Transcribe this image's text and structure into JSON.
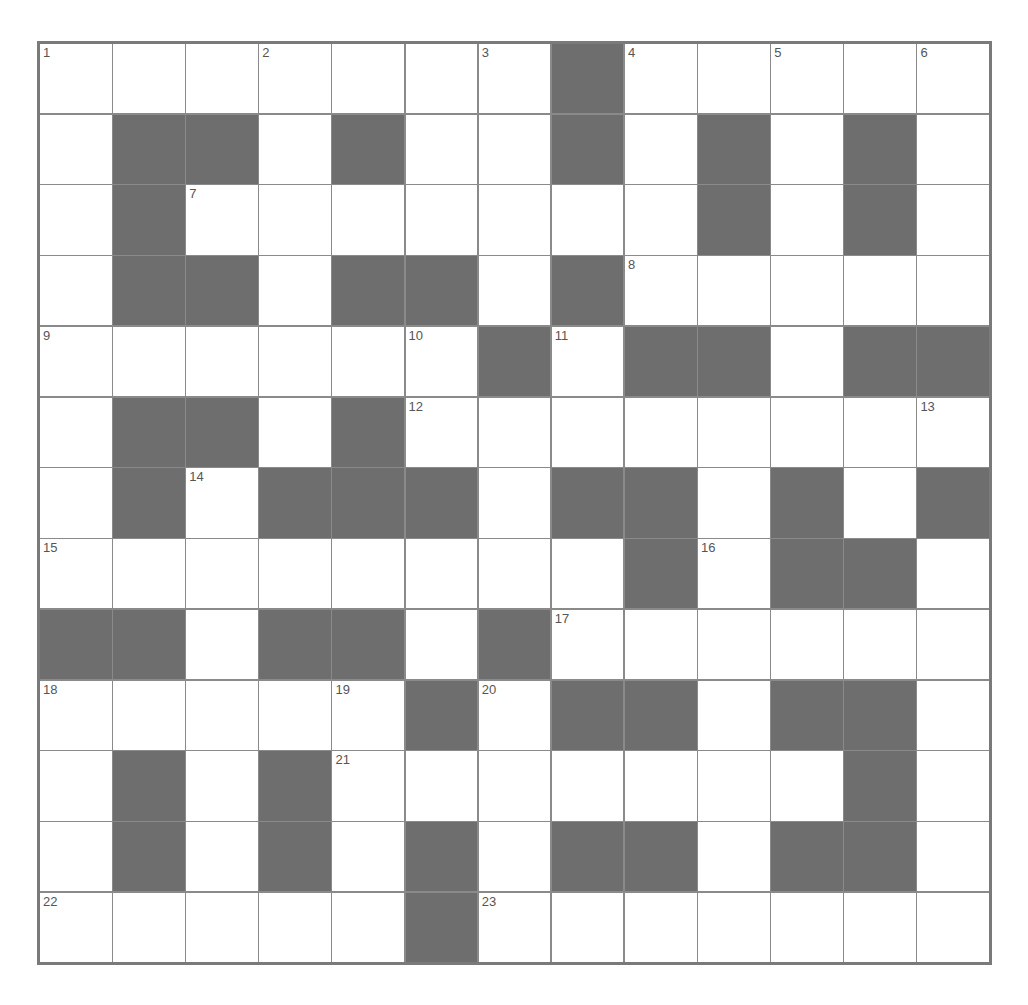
{
  "puzzle": {
    "rows": 13,
    "cols": 13,
    "colors": {
      "block": "#6e6e6e",
      "cell": "#ffffff",
      "line": "#8a8a8a",
      "border": "#7a7a7a",
      "number": "#555555"
    },
    "layout": [
      "....... .....",
      ".  . .. . . .",
      ". ....... . .",
      ".  .  . .....",
      "...... .  .  ",
      ".  . ........",
      ". .   .  . . ",
      "........ .  .",
      "  .  . ......",
      "..... .  .  .",
      ". . ....... .",
      ". . . .  .  .",
      "..... ......."
    ],
    "numbers": [
      {
        "r": 0,
        "c": 0,
        "n": "1"
      },
      {
        "r": 0,
        "c": 3,
        "n": "2"
      },
      {
        "r": 0,
        "c": 6,
        "n": "3"
      },
      {
        "r": 0,
        "c": 8,
        "n": "4"
      },
      {
        "r": 0,
        "c": 10,
        "n": "5"
      },
      {
        "r": 0,
        "c": 12,
        "n": "6"
      },
      {
        "r": 2,
        "c": 2,
        "n": "7"
      },
      {
        "r": 3,
        "c": 8,
        "n": "8"
      },
      {
        "r": 4,
        "c": 0,
        "n": "9"
      },
      {
        "r": 4,
        "c": 5,
        "n": "10"
      },
      {
        "r": 4,
        "c": 7,
        "n": "11"
      },
      {
        "r": 5,
        "c": 5,
        "n": "12"
      },
      {
        "r": 5,
        "c": 12,
        "n": "13"
      },
      {
        "r": 6,
        "c": 2,
        "n": "14"
      },
      {
        "r": 7,
        "c": 0,
        "n": "15"
      },
      {
        "r": 7,
        "c": 9,
        "n": "16"
      },
      {
        "r": 8,
        "c": 7,
        "n": "17"
      },
      {
        "r": 9,
        "c": 0,
        "n": "18"
      },
      {
        "r": 9,
        "c": 4,
        "n": "19"
      },
      {
        "r": 9,
        "c": 6,
        "n": "20"
      },
      {
        "r": 10,
        "c": 4,
        "n": "21"
      },
      {
        "r": 12,
        "c": 0,
        "n": "22"
      },
      {
        "r": 12,
        "c": 6,
        "n": "23"
      }
    ]
  }
}
